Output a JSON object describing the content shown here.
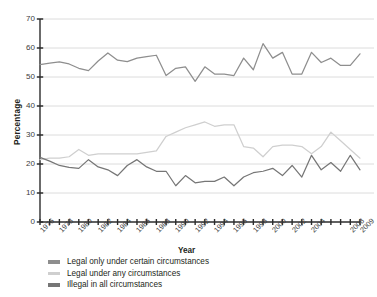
{
  "chart_data": {
    "type": "line",
    "title": "",
    "xlabel": "Year",
    "ylabel": "Percentage",
    "ylim": [
      0,
      70
    ],
    "ytick_values": [
      0,
      10,
      20,
      30,
      40,
      50,
      60,
      70
    ],
    "grid": true,
    "legend_position": "below",
    "x": [
      1976,
      1977,
      1978,
      1979,
      1980,
      1981,
      1982,
      1983,
      1984,
      1985,
      1986,
      1987,
      1988,
      1989,
      1990,
      1991,
      1992,
      1993,
      1994,
      1995,
      1996,
      1997,
      1998,
      1999,
      2000,
      2001,
      2002,
      2003,
      2004,
      2005,
      2006,
      2007,
      2008,
      2009
    ],
    "xtick_labels": [
      "1976",
      "1978",
      "1980",
      "1982",
      "1984",
      "1986",
      "1988",
      "1990",
      "1992",
      "1994",
      "1996",
      "1998",
      "2000",
      "2002",
      "2004",
      "2008",
      "2009"
    ],
    "series": [
      {
        "name": "Legal only under certain circumstances",
        "color": "#8e8e8e",
        "values": [
          54.3,
          54.8,
          55.2,
          54.5,
          53.0,
          52.2,
          55.5,
          58.3,
          55.8,
          55.3,
          56.5,
          57.0,
          57.5,
          50.5,
          53.0,
          53.5,
          48.5,
          53.5,
          51.0,
          51.0,
          50.5,
          56.5,
          52.5,
          61.5,
          56.5,
          58.5,
          51.0,
          51.0,
          58.5,
          55.0,
          56.5,
          54.0,
          54.0,
          58.0
        ]
      },
      {
        "name": "Legal under any circumstances",
        "color": "#cfcfcf",
        "values": [
          21.5,
          22.0,
          22.0,
          22.5,
          25.0,
          23.0,
          23.5,
          23.5,
          23.5,
          23.5,
          23.5,
          24.0,
          24.5,
          29.5,
          31.0,
          32.5,
          33.5,
          34.5,
          33.0,
          33.5,
          33.5,
          26.0,
          25.5,
          22.5,
          26.0,
          26.5,
          26.5,
          26.0,
          23.5,
          26.0,
          31.0,
          28.0,
          25.0,
          22.0
        ]
      },
      {
        "name": "Illegal in all circumstances",
        "color": "#767676",
        "values": [
          22.3,
          21.0,
          19.5,
          18.8,
          18.5,
          21.5,
          19.0,
          18.0,
          16.0,
          19.5,
          21.5,
          19.0,
          17.5,
          17.5,
          12.5,
          16.0,
          13.5,
          14.0,
          14.0,
          15.5,
          12.5,
          15.5,
          17.0,
          17.5,
          18.5,
          16.0,
          19.5,
          15.5,
          23.0,
          18.0,
          20.5,
          17.5,
          23.0,
          18.0
        ]
      }
    ]
  },
  "axis": {
    "y_title": "Percentage",
    "x_title": "Year"
  },
  "legend": {
    "items": [
      {
        "label": "Legal only under certain circumstances",
        "color": "#8e8e8e"
      },
      {
        "label": "Legal under any circumstances",
        "color": "#cfcfcf"
      },
      {
        "label": "Illegal in all circumstances",
        "color": "#767676"
      }
    ]
  },
  "style": {
    "grid_color": "#d8d8d8",
    "axis_color": "#2c2c2c",
    "background": "#ffffff"
  }
}
